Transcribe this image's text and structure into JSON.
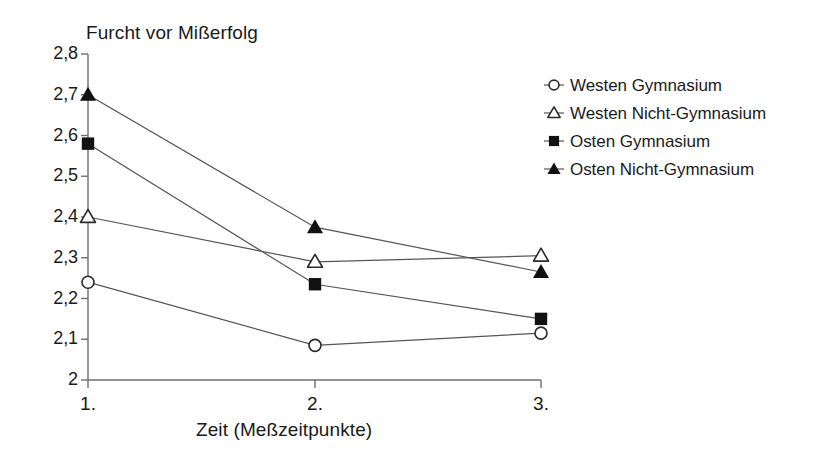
{
  "chart_data": {
    "type": "line",
    "title": "Furcht vor Mißerfolg",
    "xlabel": "Zeit (Meßzeitpunkte)",
    "ylabel": "",
    "categories": [
      "1.",
      "2.",
      "3."
    ],
    "ylim": [
      2.0,
      2.8
    ],
    "yticks": [
      "2",
      "2,1",
      "2,2",
      "2,3",
      "2,4",
      "2,5",
      "2,6",
      "2,7",
      "2,8"
    ],
    "ytick_values": [
      2.0,
      2.1,
      2.2,
      2.3,
      2.4,
      2.5,
      2.6,
      2.7,
      2.8
    ],
    "grid": false,
    "legend_position": "right",
    "series": [
      {
        "name": "Westen Gymnasium",
        "marker": "open-circle",
        "color": "#2b2b2b",
        "values": [
          2.24,
          2.085,
          2.115
        ]
      },
      {
        "name": "Westen Nicht-Gymnasium",
        "marker": "open-triangle",
        "color": "#2b2b2b",
        "values": [
          2.4,
          2.29,
          2.305
        ]
      },
      {
        "name": "Osten Gymnasium",
        "marker": "filled-square",
        "color": "#111111",
        "values": [
          2.58,
          2.235,
          2.15
        ]
      },
      {
        "name": "Osten Nicht-Gymnasium",
        "marker": "filled-triangle",
        "color": "#111111",
        "values": [
          2.7,
          2.375,
          2.265
        ]
      }
    ]
  },
  "axis": {
    "line_color": "#6f6f6f"
  }
}
